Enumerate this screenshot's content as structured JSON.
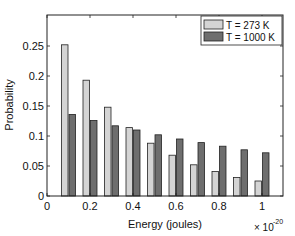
{
  "chart_data": {
    "type": "bar",
    "title": "",
    "xlabel": "Energy (joules)",
    "ylabel": "Probability",
    "x_exponent_label": "× 10",
    "x_exponent_power": "-20",
    "xlim": [
      0,
      1.08
    ],
    "ylim": [
      0,
      0.3
    ],
    "xticks": [
      0,
      0.2,
      0.4,
      0.6,
      0.8,
      1
    ],
    "xtick_labels": [
      "0",
      "0.2",
      "0.4",
      "0.6",
      "0.8",
      "1"
    ],
    "yticks": [
      0,
      0.05,
      0.1,
      0.15,
      0.2,
      0.25
    ],
    "ytick_labels": [
      "0",
      "0.05",
      "0.1",
      "0.15",
      "0.2",
      "0.25"
    ],
    "grid": false,
    "legend_position": "upper right",
    "x": [
      0.1,
      0.2,
      0.3,
      0.4,
      0.5,
      0.6,
      0.7,
      0.8,
      0.9,
      1.0
    ],
    "series": [
      {
        "name": "T = 273 K",
        "color": "#d4d4d4",
        "values": [
          0.252,
          0.193,
          0.148,
          0.114,
          0.088,
          0.068,
          0.052,
          0.041,
          0.031,
          0.025
        ]
      },
      {
        "name": "T = 1000 K",
        "color": "#6e6e6e",
        "values": [
          0.136,
          0.126,
          0.117,
          0.11,
          0.102,
          0.095,
          0.089,
          0.083,
          0.077,
          0.072
        ]
      }
    ]
  }
}
